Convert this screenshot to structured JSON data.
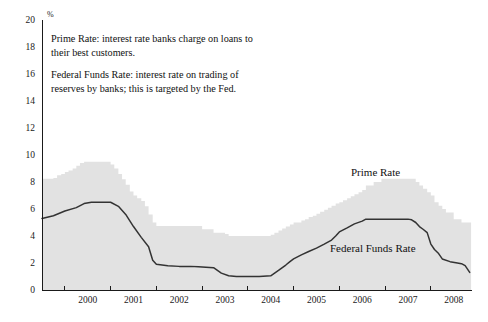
{
  "chart_data": {
    "type": "area",
    "title": "",
    "subtitle": "",
    "xlabel": "",
    "ylabel": "%",
    "unit_label": "%",
    "ylim": [
      0,
      20
    ],
    "xlim": [
      1999.5,
      2008.9
    ],
    "grid": false,
    "legend_position": "inline-annotations",
    "y_ticks": [
      0,
      2,
      4,
      6,
      8,
      10,
      12,
      14,
      16,
      18,
      20
    ],
    "y_tick_labels": [
      "0",
      "2",
      "4",
      "6",
      "8",
      "10",
      "12",
      "14",
      "16",
      "18",
      "20"
    ],
    "x_ticks": [
      2000,
      2001,
      2002,
      2003,
      2004,
      2005,
      2006,
      2007,
      2008
    ],
    "x_tick_labels": [
      "2000",
      "2001",
      "2002",
      "2003",
      "2004",
      "2005",
      "2006",
      "2007",
      "2008"
    ],
    "annotations": [
      {
        "name": "prime-rate-note",
        "lines": [
          "Prime Rate: interest rate banks charge on loans to",
          "their best customers."
        ]
      },
      {
        "name": "federal-funds-rate-note",
        "lines": [
          "Federal Funds Rate: interest rate on trading of",
          "reserves by banks; this is targeted by the Fed."
        ]
      }
    ],
    "series": [
      {
        "name": "Prime Rate",
        "label": "Prime Rate",
        "render": "area-step",
        "color": "#e2e2e2",
        "x": [
          1999.5,
          1999.58,
          1999.67,
          1999.75,
          1999.83,
          1999.92,
          2000.0,
          2000.08,
          2000.17,
          2000.25,
          2000.33,
          2000.42,
          2000.5,
          2000.58,
          2000.67,
          2000.75,
          2000.83,
          2000.92,
          2001.0,
          2001.08,
          2001.17,
          2001.25,
          2001.33,
          2001.42,
          2001.5,
          2001.58,
          2001.67,
          2001.75,
          2001.83,
          2001.92,
          2002.0,
          2002.25,
          2002.5,
          2002.75,
          2003.0,
          2003.25,
          2003.5,
          2003.58,
          2003.75,
          2004.0,
          2004.25,
          2004.5,
          2004.58,
          2004.67,
          2004.75,
          2004.83,
          2004.92,
          2005.0,
          2005.17,
          2005.25,
          2005.33,
          2005.42,
          2005.5,
          2005.58,
          2005.67,
          2005.75,
          2005.83,
          2005.92,
          2006.0,
          2006.08,
          2006.17,
          2006.25,
          2006.33,
          2006.42,
          2006.5,
          2006.58,
          2006.75,
          2006.92,
          2007.0,
          2007.25,
          2007.5,
          2007.67,
          2007.75,
          2007.83,
          2007.92,
          2008.0,
          2008.08,
          2008.17,
          2008.25,
          2008.33,
          2008.5,
          2008.67,
          2008.8,
          2008.88
        ],
        "values": [
          8.25,
          8.25,
          8.25,
          8.3,
          8.5,
          8.6,
          8.75,
          8.85,
          9.0,
          9.2,
          9.4,
          9.5,
          9.5,
          9.5,
          9.5,
          9.5,
          9.5,
          9.5,
          9.3,
          9.0,
          8.6,
          8.2,
          7.8,
          7.3,
          7.0,
          6.8,
          6.6,
          6.2,
          5.6,
          5.0,
          4.75,
          4.75,
          4.75,
          4.75,
          4.5,
          4.25,
          4.15,
          4.0,
          4.0,
          4.0,
          4.0,
          4.1,
          4.25,
          4.4,
          4.55,
          4.7,
          4.85,
          5.0,
          5.15,
          5.25,
          5.4,
          5.5,
          5.65,
          5.8,
          5.95,
          6.1,
          6.25,
          6.4,
          6.5,
          6.65,
          6.8,
          6.95,
          7.1,
          7.25,
          7.4,
          7.75,
          8.0,
          8.25,
          8.25,
          8.25,
          8.25,
          8.0,
          7.75,
          7.5,
          7.25,
          7.0,
          6.5,
          6.25,
          6.0,
          5.75,
          5.25,
          5.0,
          5.0,
          5.0
        ]
      },
      {
        "name": "Federal Funds Rate",
        "label": "Federal Funds Rate",
        "render": "line",
        "color": "#333333",
        "x": [
          1999.5,
          1999.75,
          2000.0,
          2000.25,
          2000.42,
          2000.58,
          2000.75,
          2000.92,
          2001.0,
          2001.17,
          2001.33,
          2001.5,
          2001.67,
          2001.83,
          2001.92,
          2002.0,
          2002.25,
          2002.5,
          2002.75,
          2002.92,
          2003.0,
          2003.25,
          2003.42,
          2003.58,
          2003.75,
          2003.92,
          2004.0,
          2004.25,
          2004.5,
          2004.67,
          2004.83,
          2004.92,
          2005.0,
          2005.17,
          2005.33,
          2005.5,
          2005.67,
          2005.83,
          2005.92,
          2006.0,
          2006.17,
          2006.33,
          2006.5,
          2006.58,
          2006.75,
          2006.92,
          2007.0,
          2007.25,
          2007.5,
          2007.58,
          2007.67,
          2007.75,
          2007.83,
          2007.92,
          2008.0,
          2008.08,
          2008.17,
          2008.25,
          2008.42,
          2008.58,
          2008.67,
          2008.75,
          2008.85
        ],
        "values": [
          5.3,
          5.5,
          5.85,
          6.1,
          6.4,
          6.5,
          6.5,
          6.5,
          6.5,
          6.2,
          5.6,
          4.7,
          3.9,
          3.2,
          2.2,
          1.9,
          1.8,
          1.75,
          1.75,
          1.72,
          1.7,
          1.65,
          1.25,
          1.05,
          1.0,
          1.0,
          1.0,
          1.0,
          1.05,
          1.45,
          1.85,
          2.1,
          2.3,
          2.6,
          2.85,
          3.1,
          3.4,
          3.7,
          4.0,
          4.3,
          4.6,
          4.9,
          5.1,
          5.25,
          5.25,
          5.25,
          5.25,
          5.25,
          5.25,
          5.2,
          5.0,
          4.7,
          4.5,
          4.25,
          3.4,
          3.0,
          2.7,
          2.3,
          2.1,
          2.0,
          1.95,
          1.8,
          1.3
        ]
      }
    ]
  },
  "plot_geometry": {
    "left": 42,
    "right": 472,
    "top": 20,
    "bottom": 290
  }
}
